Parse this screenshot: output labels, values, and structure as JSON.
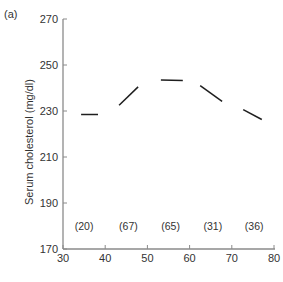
{
  "panel_label": "(a)",
  "colors": {
    "axis": "#8a8a8a",
    "series": "#1e1e1e",
    "text": "#333333"
  },
  "chart_data": {
    "type": "line",
    "title": "",
    "panel": "(a)",
    "xlabel": "",
    "ylabel": "Serum cholesterol (mg/dl)",
    "xlim": [
      30,
      80
    ],
    "ylim": [
      170,
      270
    ],
    "xticks": [
      30,
      40,
      50,
      60,
      70,
      80
    ],
    "yticks": [
      170,
      190,
      210,
      230,
      250,
      270
    ],
    "grid": false,
    "legend": null,
    "series": [
      {
        "name": "Segment 1 (n=20)",
        "x": [
          34.3,
          38.3
        ],
        "y": [
          228.5,
          228.5
        ]
      },
      {
        "name": "Segment 2 (n=67)",
        "x": [
          43.3,
          47.8
        ],
        "y": [
          232.5,
          240.5
        ]
      },
      {
        "name": "Segment 3 (n=65)",
        "x": [
          53.2,
          58.4
        ],
        "y": [
          243.5,
          243.2
        ]
      },
      {
        "name": "Segment 4 (n=31)",
        "x": [
          62.5,
          67.7
        ],
        "y": [
          241,
          234.2
        ]
      },
      {
        "name": "Segment 5 (n=36)",
        "x": [
          72.7,
          77.1
        ],
        "y": [
          230.6,
          226.3
        ]
      }
    ],
    "annotations": [
      {
        "text": "(20)",
        "x": 35,
        "y": 180
      },
      {
        "text": "(67)",
        "x": 45.5,
        "y": 180
      },
      {
        "text": "(65)",
        "x": 55.5,
        "y": 180
      },
      {
        "text": "(31)",
        "x": 65.5,
        "y": 180
      },
      {
        "text": "(36)",
        "x": 75.3,
        "y": 180
      }
    ]
  }
}
